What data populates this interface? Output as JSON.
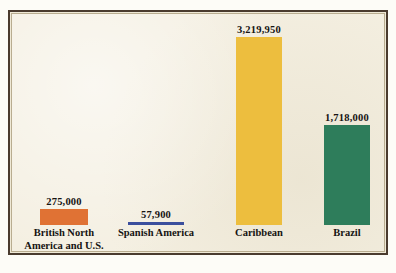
{
  "figure": {
    "frame_color": "#4a3b2e",
    "background_color": "#f4efe1",
    "caption_fragment": ""
  },
  "chart_data": {
    "type": "bar",
    "title": "",
    "subtitle": "",
    "xlabel": "",
    "ylabel": "",
    "grid": false,
    "legend": "none",
    "ylim": [
      0,
      3219950
    ],
    "categories": [
      "British North America and U.S.",
      "Spanish America",
      "Caribbean",
      "Brazil"
    ],
    "values": [
      275000,
      57900,
      3219950,
      1718000
    ],
    "value_labels": [
      "275,000",
      "57,900",
      "3,219,950",
      "1,718,000"
    ],
    "colors": [
      "#e07234",
      "#3b4f9d",
      "#edbe3e",
      "#2e7d5b"
    ],
    "bars": [
      {
        "label_line1": "British North",
        "label_line2": "America and U.S.",
        "value": 275000,
        "value_label": "275,000",
        "color": "#e07234"
      },
      {
        "label_line1": "Spanish America",
        "label_line2": "",
        "value": 57900,
        "value_label": "57,900",
        "color": "#3b4f9d"
      },
      {
        "label_line1": "Caribbean",
        "label_line2": "",
        "value": 3219950,
        "value_label": "3,219,950",
        "color": "#edbe3e"
      },
      {
        "label_line1": "Brazil",
        "label_line2": "",
        "value": 1718000,
        "value_label": "1,718,000",
        "color": "#2e7d5b"
      }
    ]
  }
}
